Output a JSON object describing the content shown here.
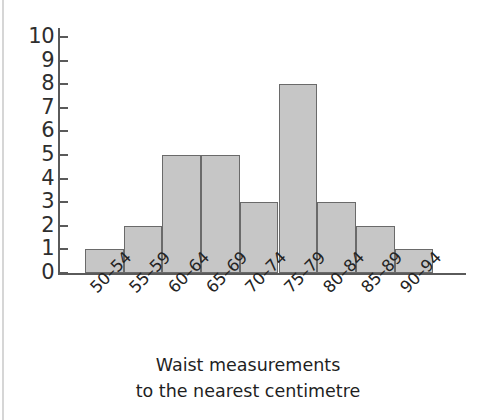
{
  "chart_data": {
    "type": "bar",
    "title": "",
    "xlabel": "Waist measurements to the nearest centimetre",
    "ylabel": "",
    "categories": [
      "50–54",
      "55–59",
      "60–64",
      "65–69",
      "70–74",
      "75–79",
      "80–84",
      "85–89",
      "90–94"
    ],
    "values": [
      1,
      2,
      5,
      5,
      3,
      8,
      3,
      2,
      1
    ],
    "ylim": [
      0,
      10
    ],
    "ytick_labels": [
      "10",
      "9",
      "8",
      "7",
      "6",
      "5",
      "4",
      "3",
      "2",
      "1",
      "0"
    ],
    "ytick_values": [
      10,
      9,
      8,
      7,
      6,
      5,
      4,
      3,
      2,
      1,
      0
    ],
    "grid": false,
    "legend": null,
    "bar_fill_color": "#c6c6c6",
    "bar_edge_color": "#6a6a6a",
    "axis_color": "#5a5a5a",
    "background_color": "#ffffff"
  },
  "axis_title": {
    "line1": "Waist measurements",
    "line2": "to the nearest centimetre"
  }
}
